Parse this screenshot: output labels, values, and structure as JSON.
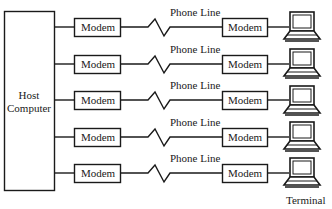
{
  "diagram": {
    "host": {
      "line1": "Host",
      "line2": "Computer"
    },
    "phone_line_label": "Phone Line",
    "modem_label": "Modem",
    "terminal_label": "Terminal",
    "rows": [
      {
        "left_modem": "Modem",
        "phone_line": "Phone Line",
        "right_modem": "Modem"
      },
      {
        "left_modem": "Modem",
        "phone_line": "Phone Line",
        "right_modem": "Modem"
      },
      {
        "left_modem": "Modem",
        "phone_line": "Phone Line",
        "right_modem": "Modem"
      },
      {
        "left_modem": "Modem",
        "phone_line": "Phone Line",
        "right_modem": "Modem"
      },
      {
        "left_modem": "Modem",
        "phone_line": "Phone Line",
        "right_modem": "Modem"
      }
    ],
    "colors": {
      "line": "#1a1a1a",
      "background": "#ffffff"
    }
  }
}
